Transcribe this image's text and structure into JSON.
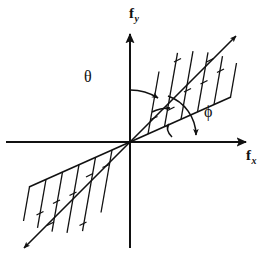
{
  "figure": {
    "background_color": "#ffffff",
    "stroke_color": "#111111",
    "width": 274,
    "height": 265
  },
  "axes": {
    "origin": {
      "x": 130,
      "y": 142
    },
    "x_axis": {
      "label": "f",
      "subscript": "x",
      "name": "f_x",
      "start": {
        "x": 6,
        "y": 142
      },
      "end": {
        "x": 252,
        "y": 142
      },
      "arrow": "right"
    },
    "y_axis": {
      "label": "f",
      "subscript": "y",
      "name": "f_y",
      "start": {
        "x": 130,
        "y": 248
      },
      "end": {
        "x": 130,
        "y": 29
      },
      "arrow": "up"
    }
  },
  "angles": [
    {
      "symbol": "θ",
      "name": "theta",
      "measured_from": "f_y axis",
      "measured_to": "upper cone boundary",
      "label_x": 84,
      "label_y": 69,
      "value_deg": 34
    },
    {
      "symbol": "ϕ",
      "name": "phi",
      "measured_from": "hatch line direction",
      "measured_to": "f_x axis",
      "label_x": 204,
      "label_y": 104,
      "value_deg": 80
    }
  ],
  "regions": [
    {
      "name": "upper-right-hatched-wedge",
      "quadrant": 1,
      "upper_boundary_angle_deg": 56,
      "lower_boundary_angle_deg": 24,
      "hatch_count": 6,
      "hatch_angle_deg": 80,
      "arrow_on_upper_boundary": true
    },
    {
      "name": "lower-left-hatched-wedge",
      "quadrant": 3,
      "upper_boundary_angle_deg": 56,
      "lower_boundary_angle_deg": 24,
      "hatch_count": 6,
      "hatch_angle_deg": 80,
      "arrow_on_upper_boundary": true
    }
  ]
}
